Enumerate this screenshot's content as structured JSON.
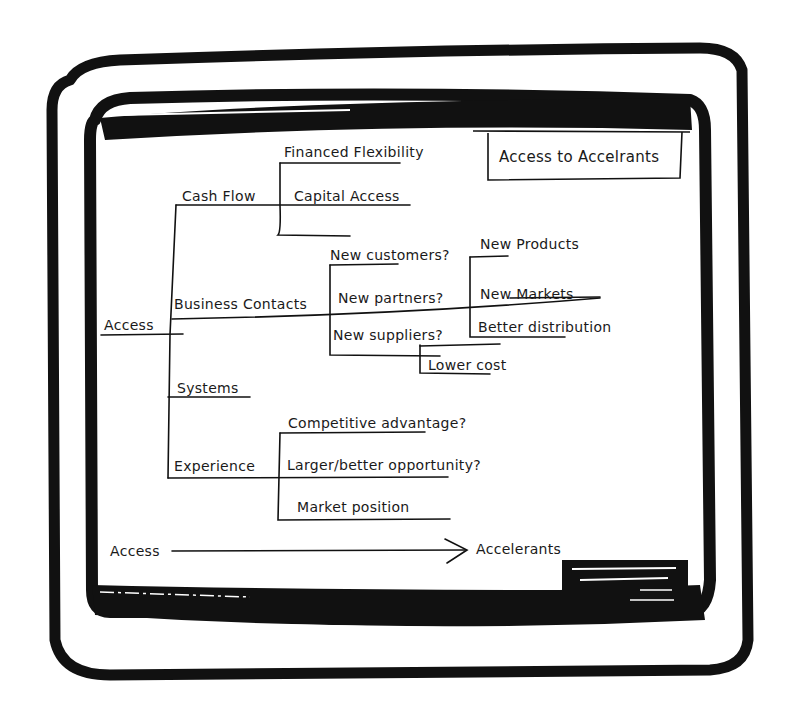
{
  "diagram": {
    "type": "hand-drawn tree / mind map on a whiteboard-style screen frame",
    "title_box": "Access to Accelrants",
    "root": "Access",
    "branches": [
      {
        "label": "Cash Flow",
        "children": [
          "Financed Flexibility",
          "Capital Access"
        ]
      },
      {
        "label": "Business Contacts",
        "children": [
          {
            "label": "New customers?",
            "children": [
              "New Products"
            ]
          },
          {
            "label": "New partners?",
            "children": [
              "New Markets"
            ]
          },
          {
            "label": "New suppliers?",
            "children": [
              "Better distribution",
              "Lower cost"
            ]
          }
        ]
      },
      {
        "label": "Systems",
        "children": []
      },
      {
        "label": "Experience",
        "children": [
          "Competitive advantage?",
          "Larger/better opportunity?",
          "Market position"
        ]
      }
    ],
    "footer_flow": {
      "from": "Access",
      "to": "Accelerants"
    }
  },
  "labels": {
    "title_box": "Access to Accelrants",
    "root": "Access",
    "cash_flow": "Cash Flow",
    "financed_flexibility": "Financed Flexibility",
    "capital_access": "Capital Access",
    "business_contacts": "Business Contacts",
    "new_customers": "New customers?",
    "new_partners": "New partners?",
    "new_suppliers": "New suppliers?",
    "new_products": "New Products",
    "new_markets": "New Markets",
    "better_distribution": "Better distribution",
    "lower_cost": "Lower cost",
    "systems": "Systems",
    "experience": "Experience",
    "competitive_advantage": "Competitive advantage?",
    "larger_better_opportunity": "Larger/better opportunity?",
    "market_position": "Market position",
    "flow_from": "Access",
    "flow_to": "Accelerants"
  },
  "colors": {
    "ink": "#111111",
    "paper": "#ffffff"
  }
}
